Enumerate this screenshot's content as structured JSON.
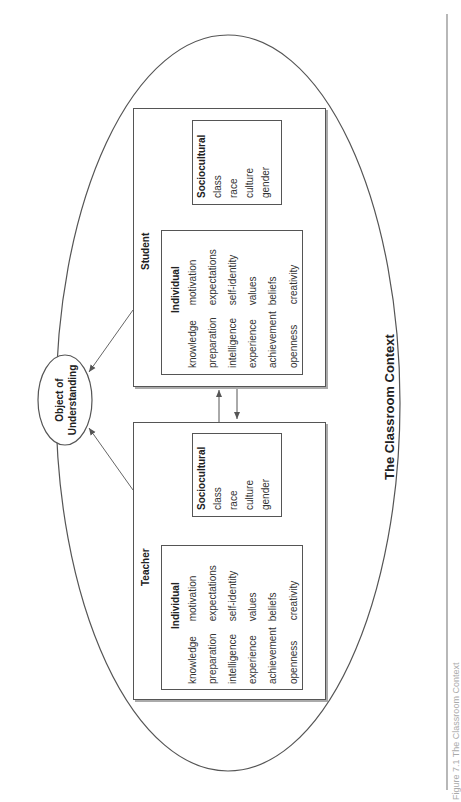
{
  "context": {
    "label": "The Classroom Context"
  },
  "object": {
    "line1": "Object of",
    "line2": "Understanding"
  },
  "student": {
    "title": "Student",
    "individual": {
      "title": "Individual",
      "col1": [
        "knowledge",
        "preparation",
        "intelligence",
        "experience",
        "achievement",
        "openness"
      ],
      "col2": [
        "motivation",
        "expectations",
        "self-identity",
        "values",
        "beliefs",
        "creativity"
      ]
    },
    "sociocultural": {
      "title": "Sociocultural",
      "items": [
        "class",
        "race",
        "culture",
        "gender"
      ]
    }
  },
  "teacher": {
    "title": "Teacher",
    "individual": {
      "title": "Individual",
      "col1": [
        "knowledge",
        "preparation",
        "intelligence",
        "experience",
        "achievement",
        "openness"
      ],
      "col2": [
        "motivation",
        "expectations",
        "self-identity",
        "values",
        "beliefs",
        "creativity"
      ]
    },
    "sociocultural": {
      "title": "Sociocultural",
      "items": [
        "class",
        "race",
        "culture",
        "gender"
      ]
    }
  },
  "caption": "Figure 7.1   The Classroom Context"
}
